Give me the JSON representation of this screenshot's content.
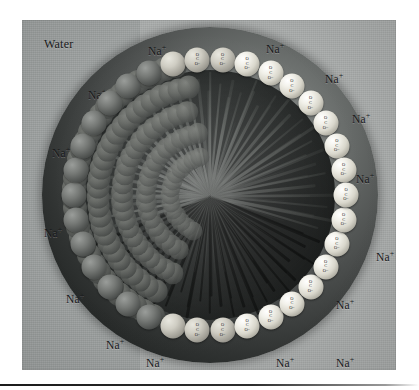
{
  "figure": {
    "title_visible": false,
    "background_color": "#a9acab",
    "panel": {
      "x": 22,
      "y": 20,
      "width": 374,
      "height": 350
    }
  },
  "labels": {
    "water": "Water",
    "sodium_ion": "Na",
    "sodium_charge": "+",
    "carboxylate": {
      "o_top": "O",
      "c": "C",
      "o_bottom": "O",
      "charge": "−"
    }
  },
  "sodium_ions": [
    {
      "id": "na-1",
      "x": 148,
      "y": 44
    },
    {
      "id": "na-2",
      "x": 266,
      "y": 42
    },
    {
      "id": "na-3",
      "x": 88,
      "y": 88
    },
    {
      "id": "na-4",
      "x": 325,
      "y": 72
    },
    {
      "id": "na-5",
      "x": 52,
      "y": 146
    },
    {
      "id": "na-6",
      "x": 352,
      "y": 112
    },
    {
      "id": "na-7",
      "x": 44,
      "y": 226
    },
    {
      "id": "na-8",
      "x": 356,
      "y": 172
    },
    {
      "id": "na-9",
      "x": 66,
      "y": 292
    },
    {
      "id": "na-10",
      "x": 376,
      "y": 250
    },
    {
      "id": "na-11",
      "x": 106,
      "y": 338
    },
    {
      "id": "na-12",
      "x": 146,
      "y": 356
    },
    {
      "id": "na-13",
      "x": 276,
      "y": 356
    },
    {
      "id": "na-14",
      "x": 336,
      "y": 356
    },
    {
      "id": "na-15",
      "x": 336,
      "y": 298
    }
  ],
  "micelle": {
    "center_x": 188,
    "center_y": 175,
    "outer_radius": 168,
    "core_radius": 125,
    "head_ring_radius": 136,
    "head_count": 34,
    "tail_count": 96,
    "core_description": "hydrocarbon tails",
    "head_description": "carboxylate head groups"
  },
  "colors": {
    "panel_bg": "#a9acab",
    "panel_band_left": "#9fa3a2",
    "core_dark": "#1b1e1d",
    "head_bright": "#f2f1ea",
    "head_back": "#64676 3",
    "text": "#17181a"
  }
}
